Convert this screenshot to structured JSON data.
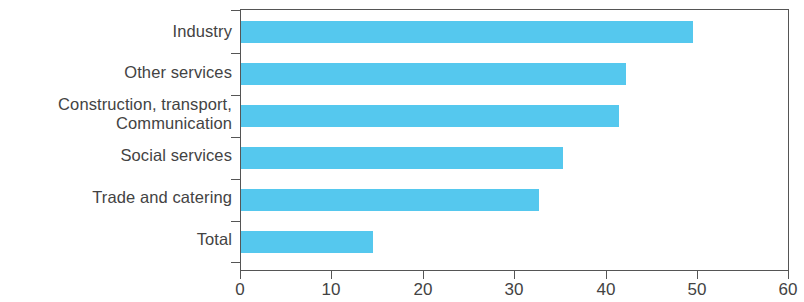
{
  "chart_data": {
    "type": "bar",
    "orientation": "horizontal",
    "title": "",
    "subtitle": "",
    "xlabel": "",
    "ylabel": "",
    "categories": [
      "Industry",
      "Other services",
      "Construction, transport,\nCommunication",
      "Social services",
      "Trade and catering",
      "Total"
    ],
    "values": [
      49.5,
      42.2,
      41.4,
      35.3,
      32.6,
      14.5
    ],
    "xlim": [
      0,
      60
    ],
    "xticks": [
      0,
      10,
      20,
      30,
      40,
      50,
      60
    ],
    "xtick_labels": [
      "0",
      "10",
      "20",
      "30",
      "40",
      "50",
      "60"
    ],
    "grid": false,
    "legend": null,
    "bar_color": "#55C8EE",
    "axis_color": "#555555",
    "text_color": "#434343",
    "background": "#ffffff"
  }
}
